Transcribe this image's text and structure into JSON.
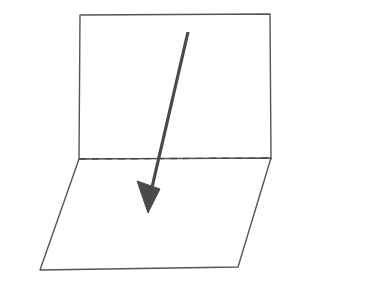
{
  "document": {
    "title": "Folded plane with direction arrow",
    "background_color": "#ffffff",
    "width": 375,
    "height": 285
  },
  "figure": {
    "name": "folded-plane-diagram",
    "stroke_color": "#555555",
    "fold_color": "#4a4a4a",
    "arrow_color": "#4a4a4a",
    "fill_color": "#ffffff",
    "stroke_width": 1.4,
    "fold_stroke_width": 1.4,
    "fold_dash_pattern": "7 6",
    "arrow_stroke_width": 3.2,
    "shapes": {
      "vertical_plane": {
        "label": "vertical-plane",
        "points": "80,15 270,14 271,159 79,159"
      },
      "horizontal_plane": {
        "label": "horizontal-plane",
        "points": "79,159 271,158 238,267 40,270"
      },
      "fold_line": {
        "label": "fold-line",
        "x1": 79,
        "y1": 159,
        "x2": 271,
        "y2": 158
      },
      "arrow_shaft": {
        "label": "arrow-shaft",
        "x1": 188,
        "y1": 32,
        "x2": 150,
        "y2": 196
      },
      "arrow_head": {
        "label": "arrow-head",
        "points": "148,213 137,181 160,189"
      }
    }
  },
  "captions": []
}
